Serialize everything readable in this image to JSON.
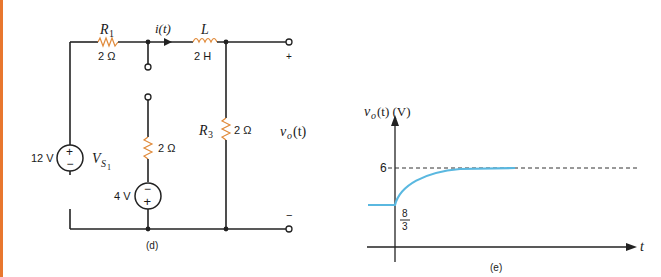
{
  "page": {
    "accent_bar_color": "#e8772e",
    "resistor_color": "#e08a3a",
    "curve_color": "#5ab8e0",
    "wire_color": "#222222"
  },
  "circuit": {
    "caption": "(d)",
    "source_main": {
      "value": "12 V",
      "name": "V",
      "sub": "S",
      "subsub": "1",
      "polarity_top": "+",
      "polarity_bottom": "−"
    },
    "r1": {
      "name": "R",
      "sub": "1",
      "value": "2 Ω"
    },
    "current_label": "i(t)",
    "inductor": {
      "name": "L",
      "value": "2 H"
    },
    "middle_resistor": {
      "value": "2 Ω"
    },
    "source_small": {
      "value": "4 V",
      "polarity_top": "−",
      "polarity_bottom": "+"
    },
    "r3": {
      "name": "R",
      "sub": "3",
      "value": "2 Ω"
    },
    "output": {
      "label": "v",
      "sub": "o",
      "suffix": "(t)",
      "plus": "+",
      "minus": "−"
    }
  },
  "graph": {
    "caption": "(e)",
    "ylabel": {
      "v": "v",
      "sub": "o",
      "rest": "(t) (V)"
    },
    "xlabel": "t",
    "y_final_label": "6",
    "y_initial_num": "8",
    "y_initial_den": "3"
  },
  "chart_data": {
    "type": "line",
    "title": "",
    "xlabel": "t",
    "ylabel": "v_o(t) (V)",
    "series": [
      {
        "name": "v_o(t)",
        "segments": [
          {
            "region": "t<0",
            "value": 2.667
          },
          {
            "region": "t>=0",
            "expression": "6 - (10/3) e^{-t/τ}",
            "initial": 2.667,
            "final": 6
          }
        ]
      }
    ],
    "annotations": [
      "6 (dashed asymptote)",
      "8/3 (initial value at t=0)"
    ],
    "grid": false
  }
}
